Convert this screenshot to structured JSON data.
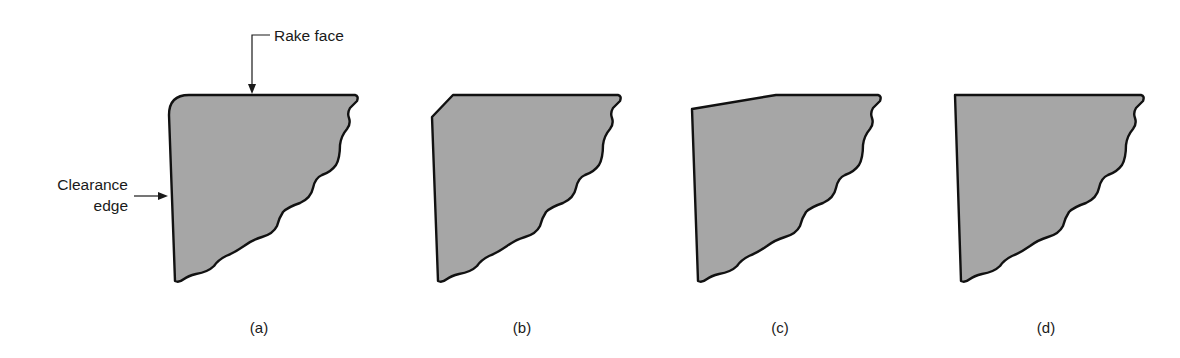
{
  "figure": {
    "fill_color": "#a6a6a6",
    "outline_color": "#111111",
    "annotations": {
      "rake_face": "Rake face",
      "clearance_edge_line1": "Clearance",
      "clearance_edge_line2": "edge"
    },
    "panels": [
      {
        "id": "a",
        "label": "(a)",
        "edge_type": "honed (rounded)"
      },
      {
        "id": "b",
        "label": "(b)",
        "edge_type": "chamfered"
      },
      {
        "id": "c",
        "label": "(c)",
        "edge_type": "negative land"
      },
      {
        "id": "d",
        "label": "(d)",
        "edge_type": "sharp"
      }
    ]
  }
}
